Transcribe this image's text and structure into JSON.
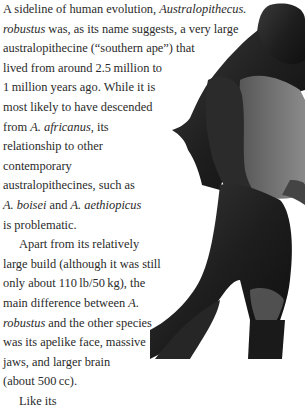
{
  "article": {
    "lines": [
      {
        "parts": [
          "A sideline of human evolution, ",
          "Australopithecus.",
          ""
        ],
        "italic": [
          false,
          true,
          false
        ]
      },
      {
        "parts": [
          "robustus",
          " was, as its name suggests, a very large",
          ""
        ],
        "italic": [
          true,
          false,
          false
        ]
      },
      {
        "parts": [
          "australopithecine (“southern ape”) that",
          "",
          ""
        ],
        "italic": [
          false,
          false,
          false
        ]
      },
      {
        "parts": [
          "lived from around 2.5 million to",
          "",
          ""
        ],
        "italic": [
          false,
          false,
          false
        ]
      },
      {
        "parts": [
          "1 million years ago. While it is",
          "",
          ""
        ],
        "italic": [
          false,
          false,
          false
        ]
      },
      {
        "parts": [
          "most likely to have descended",
          "",
          ""
        ],
        "italic": [
          false,
          false,
          false
        ]
      },
      {
        "parts": [
          "from ",
          "A. africanus,",
          " its"
        ],
        "italic": [
          false,
          true,
          false
        ]
      },
      {
        "parts": [
          "relationship to other",
          "",
          ""
        ],
        "italic": [
          false,
          false,
          false
        ]
      },
      {
        "parts": [
          "contemporary",
          "",
          ""
        ],
        "italic": [
          false,
          false,
          false
        ]
      },
      {
        "parts": [
          "australopithecines, such as",
          "",
          ""
        ],
        "italic": [
          false,
          false,
          false
        ]
      },
      {
        "parts": [
          "A. boisei",
          " and ",
          "A. aethiopicus"
        ],
        "italic": [
          true,
          false,
          true
        ]
      },
      {
        "parts": [
          "is problematic.",
          "",
          ""
        ],
        "italic": [
          false,
          false,
          false
        ]
      },
      {
        "parts": [
          "Apart from its relatively",
          "",
          ""
        ],
        "italic": [
          false,
          false,
          false
        ],
        "indent": true
      },
      {
        "parts": [
          "large build (although it was still",
          "",
          ""
        ],
        "italic": [
          false,
          false,
          false
        ]
      },
      {
        "parts": [
          "only about 110 lb/50 kg), the",
          "",
          ""
        ],
        "italic": [
          false,
          false,
          false
        ]
      },
      {
        "parts": [
          "main difference between ",
          "A.",
          ""
        ],
        "italic": [
          false,
          true,
          false
        ]
      },
      {
        "parts": [
          "robustus",
          " and the other species",
          ""
        ],
        "italic": [
          true,
          false,
          false
        ]
      },
      {
        "parts": [
          "was its apelike face, massive",
          "",
          ""
        ],
        "italic": [
          false,
          false,
          false
        ]
      },
      {
        "parts": [
          "jaws, and larger brain",
          "",
          ""
        ],
        "italic": [
          false,
          false,
          false
        ]
      },
      {
        "parts": [
          "(about 500 cc).",
          "",
          ""
        ],
        "italic": [
          false,
          false,
          false
        ]
      },
      {
        "parts": [
          "Like its",
          "",
          ""
        ],
        "italic": [
          false,
          false,
          false
        ],
        "indent": true
      }
    ]
  },
  "figure": {
    "icon": "hominid-figure-illustration"
  }
}
